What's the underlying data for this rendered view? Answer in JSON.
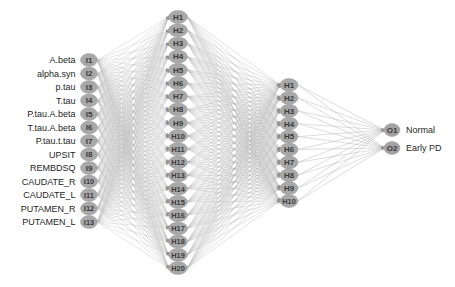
{
  "diagram": {
    "type": "neural-network-architecture",
    "title": "",
    "colors": {
      "node_fill": "#a8a8a8",
      "node_stroke": "#9a9a9a",
      "edge": "#b9b9b9",
      "node_label": "#3a3a3a",
      "feature_label": "#262626",
      "background": "#ffffff"
    },
    "layers": [
      {
        "name": "input",
        "count": 13,
        "nodes": [
          {
            "id": "I1",
            "label": "A.beta"
          },
          {
            "id": "I2",
            "label": "alpha.syn"
          },
          {
            "id": "I3",
            "label": "p.tau"
          },
          {
            "id": "I4",
            "label": "T.tau"
          },
          {
            "id": "I5",
            "label": "P.tau.A.beta"
          },
          {
            "id": "I6",
            "label": "T.tau.A.beta"
          },
          {
            "id": "I7",
            "label": "P.tau.t.tau"
          },
          {
            "id": "I8",
            "label": "UPSIT"
          },
          {
            "id": "I9",
            "label": "REMBDSQ"
          },
          {
            "id": "I10",
            "label": "CAUDATE_R"
          },
          {
            "id": "I11",
            "label": "CAUDATE_L"
          },
          {
            "id": "I12",
            "label": "PUTAMEN_R"
          },
          {
            "id": "I13",
            "label": "PUTAMEN_L"
          }
        ]
      },
      {
        "name": "hidden-1",
        "count": 20,
        "nodes": [
          {
            "id": "H1"
          },
          {
            "id": "H2"
          },
          {
            "id": "H3"
          },
          {
            "id": "H4"
          },
          {
            "id": "H5"
          },
          {
            "id": "H6"
          },
          {
            "id": "H7"
          },
          {
            "id": "H8"
          },
          {
            "id": "H9"
          },
          {
            "id": "H10"
          },
          {
            "id": "H11"
          },
          {
            "id": "H12"
          },
          {
            "id": "H13"
          },
          {
            "id": "H14"
          },
          {
            "id": "H15"
          },
          {
            "id": "H16"
          },
          {
            "id": "H17"
          },
          {
            "id": "H18"
          },
          {
            "id": "H19"
          },
          {
            "id": "H20"
          }
        ]
      },
      {
        "name": "hidden-2",
        "count": 10,
        "nodes": [
          {
            "id": "H1"
          },
          {
            "id": "H2"
          },
          {
            "id": "H3"
          },
          {
            "id": "H4"
          },
          {
            "id": "H5"
          },
          {
            "id": "H6"
          },
          {
            "id": "H7"
          },
          {
            "id": "H8"
          },
          {
            "id": "H9"
          },
          {
            "id": "H10"
          }
        ]
      },
      {
        "name": "output",
        "count": 2,
        "nodes": [
          {
            "id": "O1",
            "label": "Normal"
          },
          {
            "id": "O2",
            "label": "Early PD"
          }
        ]
      }
    ]
  }
}
